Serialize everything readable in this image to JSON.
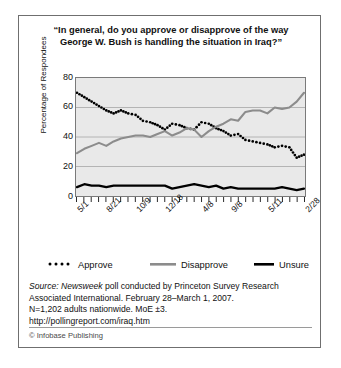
{
  "title": "“In general, do you approve or disapprove of the way George W. Bush is handling the situation in Iraq?”",
  "axis": {
    "ylabel": "Percentage of Respondees",
    "yticks": [
      "80",
      "60",
      "40",
      "20",
      "0"
    ]
  },
  "legend": [
    {
      "key": "approve",
      "label": "Approve",
      "style": "dotted",
      "color": "#000000"
    },
    {
      "key": "disapprove",
      "label": "Disapprove",
      "style": "solid",
      "color": "#8c8c8c"
    },
    {
      "key": "unsure",
      "label": "Unsure",
      "style": "solid",
      "color": "#000000"
    }
  ],
  "year_brackets": [
    {
      "label": "2005",
      "start": 0,
      "end": 0.555
    },
    {
      "label": "2006",
      "start": 0.578,
      "end": 0.895
    },
    {
      "label": "2007",
      "start": 0.918,
      "end": 1.0
    }
  ],
  "source": {
    "line1_italic": "Source: Newsweek",
    "line1_rest": " poll conducted by Princeton Survey Research",
    "line2": "Associated International. February 28–March 1, 2007.",
    "line3": "N=1,202 adults nationwide. MoE ±3.",
    "line4": "http://pollingreport.com/iraq.htm"
  },
  "credit": "© Infobase Publishing",
  "chart_data": {
    "type": "line",
    "title": "“In general, do you approve or disapprove of the way George W. Bush is handling the situation in Iraq?”",
    "xlabel": "",
    "ylabel": "Percentage of Respondees",
    "ylim": [
      0,
      80
    ],
    "grid": true,
    "legend_position": "below-plot",
    "tick_count": 32,
    "x_tick_labels": [
      {
        "label": "5/1",
        "index": 0
      },
      {
        "label": "8/21",
        "index": 4
      },
      {
        "label": "10/9",
        "index": 8
      },
      {
        "label": "12/18",
        "index": 12
      },
      {
        "label": "4/8",
        "index": 17
      },
      {
        "label": "9/8",
        "index": 21
      },
      {
        "label": "5/11",
        "index": 26
      },
      {
        "label": "2/28",
        "index": 31
      }
    ],
    "series": [
      {
        "name": "Approve",
        "color": "#000000",
        "style": "dotted",
        "values": [
          70,
          67,
          64,
          61,
          58,
          56,
          58,
          56,
          55,
          51,
          50,
          48,
          45,
          49,
          48,
          46,
          45,
          50,
          49,
          46,
          44,
          41,
          42,
          38,
          37,
          36,
          35,
          33,
          34,
          33,
          26,
          28
        ]
      },
      {
        "name": "Disapprove",
        "color": "#8c8c8c",
        "style": "solid",
        "values": [
          29,
          32,
          34,
          36,
          34,
          37,
          39,
          40,
          41,
          41,
          40,
          42,
          44,
          41,
          43,
          46,
          45,
          40,
          44,
          47,
          49,
          52,
          51,
          57,
          58,
          58,
          56,
          60,
          59,
          60,
          64,
          70
        ]
      },
      {
        "name": "Unsure",
        "color": "#000000",
        "style": "solid",
        "values": [
          6,
          8,
          7,
          7,
          6,
          7,
          7,
          7,
          7,
          7,
          7,
          7,
          7,
          5,
          6,
          7,
          8,
          7,
          6,
          7,
          5,
          6,
          5,
          5,
          5,
          5,
          5,
          5,
          6,
          5,
          4,
          5
        ]
      }
    ]
  }
}
